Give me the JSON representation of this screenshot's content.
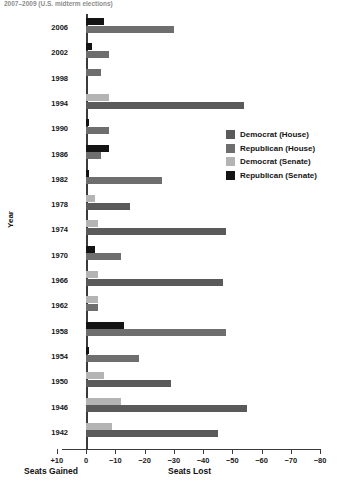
{
  "title_partial": "2007–2009 (U.S. midterm elections)",
  "axes": {
    "ylabel": "Year",
    "xticks": [
      "+10",
      "0",
      "−10",
      "−20",
      "−30",
      "−40",
      "−50",
      "−60",
      "−70",
      "−80"
    ],
    "xtick_values": [
      10,
      0,
      -10,
      -20,
      -30,
      -40,
      -50,
      -60,
      -70,
      -80
    ],
    "caption_left": "Seats Gained",
    "caption_right": "Seats Lost"
  },
  "legend": {
    "position": "right-middle",
    "items": [
      {
        "label": "Democrat (House)",
        "color": "#5a5a5a",
        "key": "dem_house"
      },
      {
        "label": "Republican (House)",
        "color": "#6e6e6e",
        "key": "rep_house"
      },
      {
        "label": "Democrat (Senate)",
        "color": "#b4b4b4",
        "key": "dem_senate"
      },
      {
        "label": "Republican (Senate)",
        "color": "#141414",
        "key": "rep_senate"
      }
    ]
  },
  "chart_data": {
    "type": "bar",
    "orientation": "horizontal",
    "title": "2007–2009 (U.S. midterm elections)",
    "xlabel": "Seats Gained / Seats Lost",
    "ylabel": "Year",
    "xlim": [
      10,
      -80
    ],
    "grid": false,
    "note": "Negative values = seats lost by the president's party; positive values = seats gained.",
    "categories": [
      2006,
      2002,
      1998,
      1994,
      1990,
      1986,
      1982,
      1978,
      1974,
      1970,
      1966,
      1962,
      1958,
      1954,
      1950,
      1946,
      1942
    ],
    "series": [
      {
        "name": "Democrat (House)",
        "color": "#5a5a5a",
        "values": [
          null,
          null,
          null,
          -54,
          null,
          null,
          null,
          -15,
          -48,
          null,
          -47,
          null,
          null,
          null,
          -29,
          -55,
          -45
        ]
      },
      {
        "name": "Republican (House)",
        "color": "#6e6e6e",
        "values": [
          -30,
          -8,
          -5,
          null,
          -8,
          -5,
          -26,
          null,
          null,
          -12,
          null,
          -4,
          -48,
          -18,
          null,
          null,
          null
        ]
      },
      {
        "name": "Democrat (Senate)",
        "color": "#b4b4b4",
        "values": [
          null,
          null,
          null,
          -8,
          null,
          null,
          null,
          -3,
          -4,
          null,
          -4,
          null,
          null,
          null,
          -6,
          -12,
          -9
        ]
      },
      {
        "name": "Republican (Senate)",
        "color": "#141414",
        "values": [
          -6,
          -2,
          null,
          null,
          -1,
          -8,
          -1,
          null,
          null,
          -3,
          null,
          null,
          -13,
          -1,
          null,
          null,
          null
        ]
      }
    ]
  },
  "rows": [
    {
      "year": "2006",
      "bars": [
        {
          "key": "rep_senate",
          "value": -6
        },
        {
          "key": "rep_house",
          "value": -30
        }
      ]
    },
    {
      "year": "2002",
      "bars": [
        {
          "key": "rep_senate",
          "value": -2
        },
        {
          "key": "rep_house",
          "value": -8
        }
      ]
    },
    {
      "year": "1998",
      "bars": [
        {
          "key": "rep_house",
          "value": -5
        }
      ]
    },
    {
      "year": "1994",
      "bars": [
        {
          "key": "dem_senate",
          "value": -8
        },
        {
          "key": "dem_house",
          "value": -54
        }
      ]
    },
    {
      "year": "1990",
      "bars": [
        {
          "key": "rep_senate",
          "value": -1
        },
        {
          "key": "rep_house",
          "value": -8
        }
      ]
    },
    {
      "year": "1986",
      "bars": [
        {
          "key": "rep_senate",
          "value": -8
        },
        {
          "key": "rep_house",
          "value": -5
        }
      ]
    },
    {
      "year": "1982",
      "bars": [
        {
          "key": "rep_senate",
          "value": -1
        },
        {
          "key": "rep_house",
          "value": -26
        }
      ]
    },
    {
      "year": "1978",
      "bars": [
        {
          "key": "dem_senate",
          "value": -3
        },
        {
          "key": "dem_house",
          "value": -15
        }
      ]
    },
    {
      "year": "1974",
      "bars": [
        {
          "key": "dem_senate",
          "value": -4
        },
        {
          "key": "dem_house",
          "value": -48
        }
      ]
    },
    {
      "year": "1970",
      "bars": [
        {
          "key": "rep_senate",
          "value": -3
        },
        {
          "key": "rep_house",
          "value": -12
        }
      ]
    },
    {
      "year": "1966",
      "bars": [
        {
          "key": "dem_senate",
          "value": -4
        },
        {
          "key": "dem_house",
          "value": -47
        }
      ]
    },
    {
      "year": "1962",
      "bars": [
        {
          "key": "dem_senate",
          "value": -4
        },
        {
          "key": "rep_house",
          "value": -4
        }
      ]
    },
    {
      "year": "1958",
      "bars": [
        {
          "key": "rep_senate",
          "value": -13
        },
        {
          "key": "rep_house",
          "value": -48
        }
      ]
    },
    {
      "year": "1954",
      "bars": [
        {
          "key": "rep_senate",
          "value": -1
        },
        {
          "key": "rep_house",
          "value": -18
        }
      ]
    },
    {
      "year": "1950",
      "bars": [
        {
          "key": "dem_senate",
          "value": -6
        },
        {
          "key": "dem_house",
          "value": -29
        }
      ]
    },
    {
      "year": "1946",
      "bars": [
        {
          "key": "dem_senate",
          "value": -12
        },
        {
          "key": "dem_house",
          "value": -55
        }
      ]
    },
    {
      "year": "1942",
      "bars": [
        {
          "key": "dem_senate",
          "value": -9
        },
        {
          "key": "dem_house",
          "value": -45
        }
      ]
    }
  ]
}
